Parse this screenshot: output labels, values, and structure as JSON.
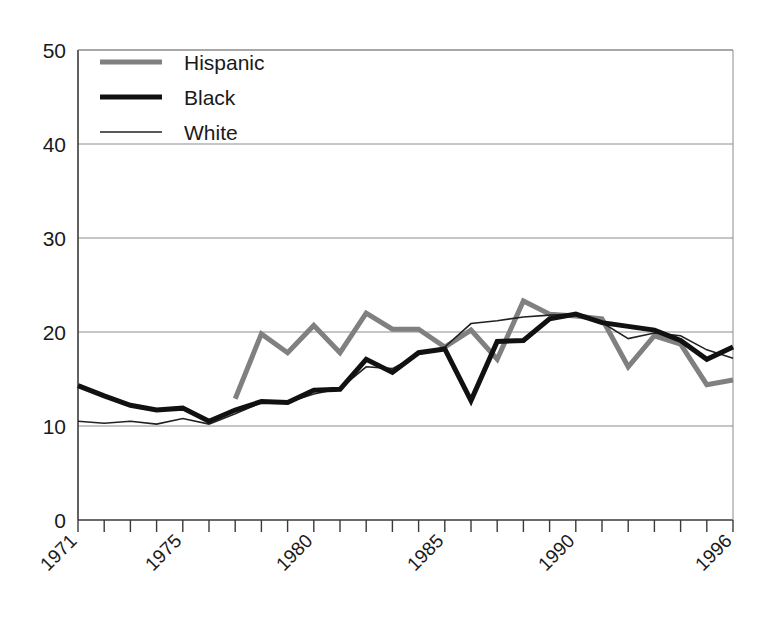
{
  "chart_data": {
    "type": "line",
    "title": "",
    "subtitle": "",
    "xlabel": "",
    "ylabel": "",
    "xlim": [
      1971,
      1996
    ],
    "ylim": [
      0,
      50
    ],
    "grid": true,
    "legend_position": "top-left",
    "y_ticks": [
      "0",
      "10",
      "20",
      "30",
      "40",
      "50"
    ],
    "y_tick_values": [
      0,
      10,
      20,
      30,
      40,
      50
    ],
    "x_ticks": [
      "1971",
      "1975",
      "1980",
      "1985",
      "1990",
      "1996"
    ],
    "x_tick_values": [
      1971,
      1975,
      1980,
      1985,
      1990,
      1996
    ],
    "x_all_years": [
      1971,
      1972,
      1973,
      1974,
      1975,
      1976,
      1977,
      1978,
      1979,
      1980,
      1981,
      1982,
      1983,
      1984,
      1985,
      1986,
      1987,
      1988,
      1989,
      1990,
      1991,
      1992,
      1993,
      1994,
      1995,
      1996
    ],
    "series": [
      {
        "name": "Hispanic",
        "color": "#808080",
        "width": 5.0,
        "x": [
          1977,
          1978,
          1979,
          1980,
          1981,
          1982,
          1983,
          1984,
          1985,
          1986,
          1987,
          1988,
          1989,
          1990,
          1991,
          1992,
          1993,
          1994,
          1995,
          1996
        ],
        "values": [
          12.9,
          19.8,
          17.8,
          20.7,
          17.8,
          22.0,
          20.3,
          20.3,
          18.4,
          20.2,
          17.1,
          23.3,
          21.9,
          21.7,
          21.4,
          16.3,
          19.6,
          18.7,
          14.4,
          14.9
        ]
      },
      {
        "name": "Black",
        "color": "#111111",
        "width": 5.0,
        "x": [
          1971,
          1972,
          1973,
          1974,
          1975,
          1976,
          1977,
          1978,
          1979,
          1980,
          1981,
          1982,
          1983,
          1984,
          1985,
          1986,
          1987,
          1988,
          1989,
          1990,
          1991,
          1992,
          1993,
          1994,
          1995,
          1996
        ],
        "values": [
          14.3,
          13.2,
          12.2,
          11.7,
          11.9,
          10.5,
          11.7,
          12.6,
          12.5,
          13.8,
          13.9,
          17.1,
          15.7,
          17.8,
          18.2,
          12.7,
          19.0,
          19.1,
          21.4,
          21.9,
          21.0,
          20.6,
          20.2,
          19.1,
          17.1,
          18.4
        ]
      },
      {
        "name": "White",
        "color": "#222222",
        "width": 1.6,
        "x": [
          1971,
          1972,
          1973,
          1974,
          1975,
          1976,
          1977,
          1978,
          1979,
          1980,
          1981,
          1982,
          1983,
          1984,
          1985,
          1986,
          1987,
          1988,
          1989,
          1990,
          1991,
          1992,
          1993,
          1994,
          1995,
          1996
        ],
        "values": [
          10.5,
          10.3,
          10.5,
          10.2,
          10.8,
          10.2,
          11.3,
          12.5,
          12.5,
          13.4,
          14.0,
          16.3,
          16.1,
          17.6,
          18.4,
          20.9,
          21.2,
          21.6,
          21.8,
          21.9,
          21.0,
          19.3,
          19.9,
          19.6,
          18.1,
          17.2
        ]
      }
    ]
  },
  "legend": {
    "items": [
      {
        "label": "Hispanic",
        "color": "#808080",
        "width": 5.0
      },
      {
        "label": "Black",
        "color": "#111111",
        "width": 5.0
      },
      {
        "label": "White",
        "color": "#222222",
        "width": 1.6
      }
    ]
  }
}
